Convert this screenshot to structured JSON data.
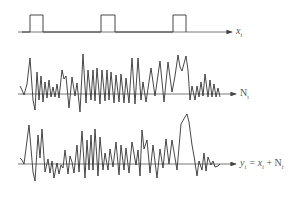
{
  "diagram": {
    "colors": {
      "line": "#333333",
      "axis": "#555555",
      "label": "#555555"
    },
    "rows": [
      {
        "id": "x",
        "label": "x",
        "label_sub": "t",
        "axis_y": 32,
        "kind": "pulse",
        "pulses": [
          [
            30,
            43
          ],
          [
            101,
            115
          ],
          [
            173,
            186
          ]
        ],
        "pulse_top": 15
      },
      {
        "id": "N",
        "label": "N",
        "label_sub": "t",
        "axis_y": 94,
        "kind": "noise"
      },
      {
        "id": "y",
        "label": "y",
        "label_sub": "t",
        "equation": "= x",
        "equation_sub": "t",
        "equation_plus": "+ N",
        "equation_sub2": "t",
        "axis_y": 164,
        "kind": "noise"
      }
    ],
    "noise_points": [
      [
        20,
        86
      ],
      [
        22,
        90
      ],
      [
        24,
        95
      ],
      [
        27,
        84
      ],
      [
        30,
        58
      ],
      [
        33,
        100
      ],
      [
        35,
        110
      ],
      [
        37,
        72
      ],
      [
        39,
        100
      ],
      [
        41,
        76
      ],
      [
        43,
        102
      ],
      [
        45,
        82
      ],
      [
        47,
        98
      ],
      [
        49,
        80
      ],
      [
        51,
        97
      ],
      [
        53,
        87
      ],
      [
        55,
        97
      ],
      [
        57,
        84
      ],
      [
        59,
        98
      ],
      [
        62,
        70
      ],
      [
        64,
        79
      ],
      [
        66,
        76
      ],
      [
        69,
        108
      ],
      [
        72,
        77
      ],
      [
        75,
        96
      ],
      [
        77,
        83
      ],
      [
        80,
        112
      ],
      [
        83,
        54
      ],
      [
        86,
        103
      ],
      [
        88,
        70
      ],
      [
        91,
        100
      ],
      [
        93,
        70
      ],
      [
        95,
        101
      ],
      [
        97,
        68
      ],
      [
        100,
        104
      ],
      [
        102,
        70
      ],
      [
        105,
        101
      ],
      [
        107,
        70
      ],
      [
        109,
        100
      ],
      [
        111,
        72
      ],
      [
        114,
        103
      ],
      [
        116,
        75
      ],
      [
        119,
        102
      ],
      [
        121,
        74
      ],
      [
        124,
        103
      ],
      [
        126,
        78
      ],
      [
        129,
        103
      ],
      [
        132,
        58
      ],
      [
        135,
        104
      ],
      [
        138,
        58
      ],
      [
        141,
        100
      ],
      [
        143,
        82
      ],
      [
        146,
        102
      ],
      [
        151,
        68
      ],
      [
        155,
        96
      ],
      [
        160,
        61
      ],
      [
        164,
        102
      ],
      [
        168,
        62
      ],
      [
        172,
        92
      ],
      [
        175,
        76
      ],
      [
        178,
        55
      ],
      [
        180,
        67
      ],
      [
        182,
        71
      ],
      [
        186,
        56
      ],
      [
        188,
        70
      ],
      [
        190,
        100
      ],
      [
        192,
        86
      ],
      [
        195,
        100
      ],
      [
        197,
        86
      ],
      [
        199,
        97
      ],
      [
        201,
        82
      ],
      [
        203,
        96
      ],
      [
        205,
        74
      ],
      [
        208,
        97
      ],
      [
        210,
        80
      ],
      [
        212,
        97
      ],
      [
        214,
        84
      ],
      [
        216,
        97
      ],
      [
        218,
        88
      ],
      [
        220,
        97
      ]
    ],
    "sum_points": [
      [
        20,
        158
      ],
      [
        22,
        160
      ],
      [
        24,
        164
      ],
      [
        29,
        125
      ],
      [
        33,
        172
      ],
      [
        35,
        181
      ],
      [
        38,
        135
      ],
      [
        40,
        158
      ],
      [
        42,
        129
      ],
      [
        45,
        172
      ],
      [
        48,
        159
      ],
      [
        50,
        173
      ],
      [
        52,
        161
      ],
      [
        54,
        178
      ],
      [
        57,
        163
      ],
      [
        59,
        174
      ],
      [
        61,
        165
      ],
      [
        63,
        168
      ],
      [
        65,
        150
      ],
      [
        68,
        174
      ],
      [
        70,
        156
      ],
      [
        72,
        162
      ],
      [
        74,
        173
      ],
      [
        77,
        145
      ],
      [
        79,
        172
      ],
      [
        82,
        131
      ],
      [
        85,
        178
      ],
      [
        87,
        140
      ],
      [
        89,
        170
      ],
      [
        91,
        135
      ],
      [
        93,
        170
      ],
      [
        95,
        129
      ],
      [
        98,
        176
      ],
      [
        100,
        137
      ],
      [
        103,
        170
      ],
      [
        105,
        153
      ],
      [
        108,
        170
      ],
      [
        110,
        149
      ],
      [
        113,
        167
      ],
      [
        116,
        142
      ],
      [
        119,
        175
      ],
      [
        121,
        145
      ],
      [
        124,
        170
      ],
      [
        126,
        148
      ],
      [
        129,
        173
      ],
      [
        132,
        142
      ],
      [
        136,
        165
      ],
      [
        138,
        150
      ],
      [
        140,
        176
      ],
      [
        142,
        130
      ],
      [
        144,
        149
      ],
      [
        147,
        140
      ],
      [
        150,
        173
      ],
      [
        153,
        145
      ],
      [
        157,
        178
      ],
      [
        160,
        149
      ],
      [
        163,
        168
      ],
      [
        166,
        139
      ],
      [
        169,
        164
      ],
      [
        172,
        140
      ],
      [
        177,
        170
      ],
      [
        181,
        124
      ],
      [
        185,
        117
      ],
      [
        187,
        114
      ],
      [
        189,
        122
      ],
      [
        192,
        145
      ],
      [
        194,
        156
      ],
      [
        197,
        176
      ],
      [
        199,
        161
      ],
      [
        202,
        170
      ],
      [
        204,
        153
      ],
      [
        206,
        171
      ],
      [
        208,
        157
      ],
      [
        211,
        165
      ],
      [
        213,
        161
      ],
      [
        215,
        167
      ],
      [
        218,
        166
      ],
      [
        220,
        164
      ]
    ]
  }
}
